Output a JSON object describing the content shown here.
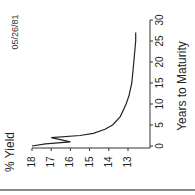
{
  "chart_data": {
    "type": "line",
    "title": "05/26/81",
    "xlabel": "Years to Maturity",
    "ylabel": "% Yield",
    "orientation": "rotated-90-ccw",
    "xlim": [
      0,
      30
    ],
    "ylim": [
      12.3,
      18
    ],
    "x_ticks": [
      0,
      5,
      10,
      15,
      20,
      25,
      30
    ],
    "y_ticks": [
      18,
      17,
      16,
      15,
      14,
      13
    ],
    "grid": false,
    "legend": null,
    "series": [
      {
        "name": "Yield curve 05/26/81",
        "x": [
          0,
          0.5,
          1,
          2,
          2.5,
          3,
          4,
          5,
          7,
          10,
          12,
          15,
          20,
          25,
          27
        ],
        "y": [
          18.0,
          17.3,
          16.0,
          17.0,
          15.5,
          14.8,
          14.2,
          13.8,
          13.4,
          13.1,
          12.95,
          12.8,
          12.7,
          12.6,
          12.6
        ]
      }
    ]
  },
  "colors": {
    "line": "#222222",
    "axis": "#333333",
    "rule": "#8a8a8a"
  }
}
